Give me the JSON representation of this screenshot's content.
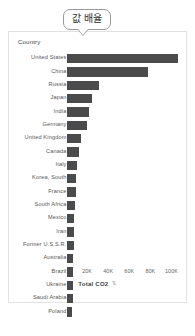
{
  "tooltip": {
    "text": "값 배율"
  },
  "card": {
    "country_header": "Country"
  },
  "axis_title": {
    "label": "Total CO2",
    "sort_icon": "sort-icon"
  },
  "chart_data": {
    "type": "bar",
    "orientation": "horizontal",
    "title": "",
    "xlabel": "Total CO2",
    "ylabel": "Country",
    "xlim": [
      0,
      110000
    ],
    "grid": false,
    "legend": null,
    "bar_color": "#4b4b4b",
    "tick_labels": [
      "20K",
      "40K",
      "60K",
      "80K",
      "100K"
    ],
    "tick_values": [
      20000,
      40000,
      60000,
      80000,
      100000
    ],
    "categories": [
      "United States",
      "China",
      "Russia",
      "Japan",
      "India",
      "Germany",
      "United Kingdom",
      "Canada",
      "Italy",
      "Korea, South",
      "France",
      "South Africa",
      "Mexico",
      "Iran",
      "Former U.S.S.R.",
      "Australia",
      "Brazil",
      "Ukraine",
      "Saudi Arabia",
      "Poland"
    ],
    "values": [
      105000,
      77000,
      30000,
      24000,
      21000,
      19000,
      13000,
      11500,
      9500,
      9000,
      8500,
      8000,
      7000,
      6500,
      6200,
      6000,
      5800,
      5600,
      5400,
      5200
    ]
  }
}
